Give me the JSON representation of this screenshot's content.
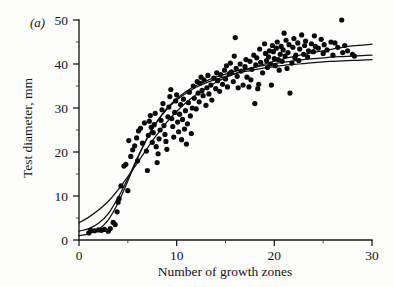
{
  "figure": {
    "panel_label": "(a)",
    "background_color": "#fdfdfc",
    "ink_color": "#0a0a0a"
  },
  "chart_data": {
    "type": "scatter",
    "title": "",
    "subtitle": "",
    "xlabel": "Number of growth zones",
    "ylabel": "Test diameter, mm",
    "xlim": [
      0,
      30
    ],
    "ylim": [
      0,
      50
    ],
    "xticks": [
      0,
      10,
      20,
      30
    ],
    "xtick_labels": [
      "0",
      "10",
      "20",
      "30"
    ],
    "yticks": [
      0,
      10,
      20,
      30,
      40,
      50
    ],
    "ytick_labels": [
      "0",
      "10",
      "20",
      "30",
      "40",
      "50"
    ],
    "x_minor_tick_interval": 5,
    "y_minor_tick_interval": 5,
    "grid": false,
    "legend": false,
    "legend_position": "none",
    "marker": "filled-circle",
    "marker_color": "#0a0a0a",
    "marker_size_px": 5.2,
    "n_points": 191,
    "points": [
      [
        1.0,
        1.6
      ],
      [
        1.2,
        2.2
      ],
      [
        1.6,
        2.1
      ],
      [
        2.0,
        2.3
      ],
      [
        2.3,
        2.2
      ],
      [
        2.6,
        2.4
      ],
      [
        3.0,
        2.0
      ],
      [
        3.2,
        2.6
      ],
      [
        3.5,
        4.0
      ],
      [
        3.7,
        3.5
      ],
      [
        3.9,
        6.4
      ],
      [
        4.0,
        8.6
      ],
      [
        4.1,
        9.4
      ],
      [
        4.3,
        12.3
      ],
      [
        4.6,
        16.8
      ],
      [
        4.8,
        17.2
      ],
      [
        5.0,
        11.2
      ],
      [
        5.1,
        22.6
      ],
      [
        5.3,
        19.0
      ],
      [
        5.5,
        20.5
      ],
      [
        5.7,
        21.4
      ],
      [
        5.9,
        23.2
      ],
      [
        6.0,
        18.0
      ],
      [
        6.1,
        24.8
      ],
      [
        6.3,
        25.4
      ],
      [
        6.5,
        22.0
      ],
      [
        6.7,
        26.6
      ],
      [
        6.9,
        20.2
      ],
      [
        7.0,
        15.8
      ],
      [
        7.1,
        23.8
      ],
      [
        7.2,
        27.0
      ],
      [
        7.3,
        28.3
      ],
      [
        7.4,
        25.6
      ],
      [
        7.5,
        22.2
      ],
      [
        7.6,
        24.4
      ],
      [
        7.7,
        26.2
      ],
      [
        7.8,
        28.8
      ],
      [
        7.9,
        21.2
      ],
      [
        8.0,
        17.6
      ],
      [
        8.1,
        19.6
      ],
      [
        8.2,
        23.0
      ],
      [
        8.3,
        25.0
      ],
      [
        8.4,
        27.2
      ],
      [
        8.5,
        29.6
      ],
      [
        8.6,
        31.0
      ],
      [
        8.7,
        26.0
      ],
      [
        8.8,
        24.0
      ],
      [
        8.9,
        22.4
      ],
      [
        9.0,
        20.6
      ],
      [
        9.1,
        28.0
      ],
      [
        9.2,
        30.2
      ],
      [
        9.3,
        32.6
      ],
      [
        9.4,
        34.2
      ],
      [
        9.5,
        27.6
      ],
      [
        9.6,
        25.8
      ],
      [
        9.7,
        23.4
      ],
      [
        9.8,
        29.0
      ],
      [
        9.9,
        31.6
      ],
      [
        10.0,
        33.0
      ],
      [
        10.1,
        26.8
      ],
      [
        10.2,
        24.6
      ],
      [
        10.3,
        28.6
      ],
      [
        10.4,
        30.8
      ],
      [
        10.5,
        22.8
      ],
      [
        10.6,
        27.4
      ],
      [
        10.7,
        32.0
      ],
      [
        10.8,
        25.2
      ],
      [
        10.9,
        29.4
      ],
      [
        11.0,
        21.8
      ],
      [
        11.1,
        26.4
      ],
      [
        11.2,
        31.2
      ],
      [
        11.3,
        33.6
      ],
      [
        11.4,
        28.2
      ],
      [
        11.5,
        24.2
      ],
      [
        11.6,
        30.0
      ],
      [
        11.7,
        35.0
      ],
      [
        11.8,
        32.2
      ],
      [
        12.0,
        29.8
      ],
      [
        12.1,
        36.0
      ],
      [
        12.2,
        33.4
      ],
      [
        12.3,
        31.4
      ],
      [
        12.4,
        35.6
      ],
      [
        12.5,
        37.0
      ],
      [
        12.6,
        34.0
      ],
      [
        12.7,
        32.8
      ],
      [
        12.8,
        36.4
      ],
      [
        13.0,
        30.6
      ],
      [
        13.1,
        34.6
      ],
      [
        13.2,
        37.4
      ],
      [
        13.3,
        33.2
      ],
      [
        13.5,
        35.2
      ],
      [
        13.6,
        31.8
      ],
      [
        13.8,
        36.8
      ],
      [
        14.0,
        34.4
      ],
      [
        14.1,
        38.0
      ],
      [
        14.2,
        36.2
      ],
      [
        14.4,
        33.8
      ],
      [
        14.5,
        37.6
      ],
      [
        14.7,
        35.4
      ],
      [
        14.9,
        38.6
      ],
      [
        15.0,
        36.6
      ],
      [
        15.1,
        39.6
      ],
      [
        15.2,
        34.8
      ],
      [
        15.4,
        37.8
      ],
      [
        15.5,
        40.2
      ],
      [
        15.6,
        38.2
      ],
      [
        15.8,
        36.0
      ],
      [
        15.9,
        41.8
      ],
      [
        16.0,
        46.0
      ],
      [
        16.1,
        39.0
      ],
      [
        16.2,
        37.2
      ],
      [
        16.3,
        34.6
      ],
      [
        16.5,
        40.0
      ],
      [
        16.6,
        38.4
      ],
      [
        16.8,
        35.2
      ],
      [
        17.0,
        39.4
      ],
      [
        17.1,
        41.0
      ],
      [
        17.2,
        37.0
      ],
      [
        17.4,
        34.8
      ],
      [
        17.5,
        40.6
      ],
      [
        17.7,
        38.8
      ],
      [
        17.9,
        42.0
      ],
      [
        18.0,
        31.0
      ],
      [
        18.1,
        39.8
      ],
      [
        18.2,
        41.4
      ],
      [
        18.4,
        35.4
      ],
      [
        18.5,
        43.4
      ],
      [
        18.6,
        40.4
      ],
      [
        18.8,
        38.0
      ],
      [
        19.0,
        44.6
      ],
      [
        19.1,
        42.4
      ],
      [
        19.2,
        40.8
      ],
      [
        19.3,
        39.2
      ],
      [
        19.4,
        41.6
      ],
      [
        19.5,
        43.0
      ],
      [
        19.6,
        40.0
      ],
      [
        19.8,
        44.2
      ],
      [
        19.9,
        42.8
      ],
      [
        20.0,
        41.2
      ],
      [
        20.1,
        39.6
      ],
      [
        20.2,
        43.6
      ],
      [
        20.3,
        45.0
      ],
      [
        20.4,
        41.0
      ],
      [
        20.5,
        38.6
      ],
      [
        20.6,
        42.2
      ],
      [
        20.7,
        44.0
      ],
      [
        20.8,
        40.6
      ],
      [
        20.9,
        43.2
      ],
      [
        21.0,
        47.0
      ],
      [
        21.1,
        41.8
      ],
      [
        21.2,
        45.4
      ],
      [
        21.3,
        39.0
      ],
      [
        21.4,
        42.6
      ],
      [
        21.5,
        44.4
      ],
      [
        21.6,
        33.4
      ],
      [
        21.8,
        40.2
      ],
      [
        21.9,
        43.8
      ],
      [
        22.0,
        45.8
      ],
      [
        22.1,
        41.4
      ],
      [
        22.2,
        42.0
      ],
      [
        22.4,
        44.8
      ],
      [
        22.5,
        40.8
      ],
      [
        22.6,
        43.4
      ],
      [
        22.8,
        46.6
      ],
      [
        23.0,
        42.2
      ],
      [
        23.1,
        44.2
      ],
      [
        23.2,
        45.2
      ],
      [
        23.4,
        41.6
      ],
      [
        23.5,
        43.0
      ],
      [
        23.8,
        44.6
      ],
      [
        24.0,
        42.8
      ],
      [
        24.1,
        46.4
      ],
      [
        24.2,
        44.0
      ],
      [
        24.5,
        43.6
      ],
      [
        24.8,
        45.6
      ],
      [
        25.0,
        42.4
      ],
      [
        25.1,
        44.4
      ],
      [
        25.4,
        43.2
      ],
      [
        25.8,
        45.0
      ],
      [
        26.0,
        42.0
      ],
      [
        26.2,
        44.8
      ],
      [
        26.5,
        43.8
      ],
      [
        26.9,
        50.0
      ],
      [
        27.0,
        42.6
      ],
      [
        27.2,
        44.2
      ],
      [
        27.5,
        43.0
      ],
      [
        28.0,
        42.2
      ],
      [
        28.2,
        41.8
      ],
      [
        19.7,
        35.2
      ],
      [
        18.3,
        34.4
      ],
      [
        17.6,
        36.4
      ]
    ],
    "fitted_curves": [
      {
        "name": "curve-upper",
        "description": "upper fitted growth curve, rises to about 44.5 mm at 30 growth zones",
        "start": [
          0,
          3.9
        ],
        "end": [
          30,
          44.5
        ],
        "points": [
          [
            0,
            3.9
          ],
          [
            1,
            5.2
          ],
          [
            2,
            6.8
          ],
          [
            3,
            8.8
          ],
          [
            4,
            11.4
          ],
          [
            5,
            14.4
          ],
          [
            6,
            17.6
          ],
          [
            7,
            20.9
          ],
          [
            8,
            24.0
          ],
          [
            9,
            26.8
          ],
          [
            10,
            29.2
          ],
          [
            11,
            31.3
          ],
          [
            12,
            33.0
          ],
          [
            13,
            34.5
          ],
          [
            14,
            35.8
          ],
          [
            15,
            36.9
          ],
          [
            16,
            37.8
          ],
          [
            17,
            38.6
          ],
          [
            18,
            39.3
          ],
          [
            19,
            40.0
          ],
          [
            20,
            40.6
          ],
          [
            21,
            41.2
          ],
          [
            22,
            41.7
          ],
          [
            23,
            42.2
          ],
          [
            24,
            42.6
          ],
          [
            25,
            43.0
          ],
          [
            26,
            43.4
          ],
          [
            27,
            43.8
          ],
          [
            28,
            44.1
          ],
          [
            29,
            44.3
          ],
          [
            30,
            44.5
          ]
        ]
      },
      {
        "name": "curve-lower",
        "description": "lower fitted sigmoid growth curve, plateaus near 41 mm",
        "start": [
          0,
          1.0
        ],
        "end": [
          30,
          41.0
        ],
        "points": [
          [
            0,
            1.0
          ],
          [
            1,
            1.4
          ],
          [
            2,
            2.4
          ],
          [
            3,
            4.6
          ],
          [
            4,
            8.4
          ],
          [
            5,
            13.4
          ],
          [
            6,
            18.6
          ],
          [
            7,
            23.2
          ],
          [
            8,
            26.9
          ],
          [
            9,
            29.7
          ],
          [
            10,
            31.8
          ],
          [
            11,
            33.4
          ],
          [
            12,
            34.7
          ],
          [
            13,
            35.7
          ],
          [
            14,
            36.5
          ],
          [
            15,
            37.2
          ],
          [
            16,
            37.8
          ],
          [
            17,
            38.3
          ],
          [
            18,
            38.7
          ],
          [
            19,
            39.1
          ],
          [
            20,
            39.4
          ],
          [
            21,
            39.7
          ],
          [
            22,
            39.9
          ],
          [
            23,
            40.1
          ],
          [
            24,
            40.3
          ],
          [
            25,
            40.5
          ],
          [
            26,
            40.6
          ],
          [
            27,
            40.7
          ],
          [
            28,
            40.8
          ],
          [
            29,
            40.9
          ],
          [
            30,
            41.0
          ]
        ]
      },
      {
        "name": "curve-middle",
        "description": "third fitted curve overlapping the others, ending near 42 mm",
        "start": [
          0,
          2.0
        ],
        "end": [
          30,
          42.0
        ],
        "points": [
          [
            0,
            2.0
          ],
          [
            1,
            2.6
          ],
          [
            2,
            3.8
          ],
          [
            3,
            6.0
          ],
          [
            4,
            9.6
          ],
          [
            5,
            14.0
          ],
          [
            6,
            18.8
          ],
          [
            7,
            23.3
          ],
          [
            8,
            27.0
          ],
          [
            9,
            29.9
          ],
          [
            10,
            32.1
          ],
          [
            11,
            33.8
          ],
          [
            12,
            35.1
          ],
          [
            13,
            36.1
          ],
          [
            14,
            37.0
          ],
          [
            15,
            37.7
          ],
          [
            16,
            38.3
          ],
          [
            17,
            38.8
          ],
          [
            18,
            39.3
          ],
          [
            19,
            39.7
          ],
          [
            20,
            40.1
          ],
          [
            21,
            40.4
          ],
          [
            22,
            40.7
          ],
          [
            23,
            41.0
          ],
          [
            24,
            41.2
          ],
          [
            25,
            41.4
          ],
          [
            26,
            41.6
          ],
          [
            27,
            41.7
          ],
          [
            28,
            41.8
          ],
          [
            29,
            41.9
          ],
          [
            30,
            42.0
          ]
        ]
      }
    ]
  }
}
